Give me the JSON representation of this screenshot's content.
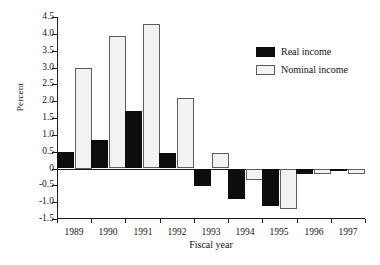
{
  "chart_data": {
    "type": "bar",
    "title": "",
    "xlabel": "Fiscal year",
    "ylabel": "Percent",
    "categories": [
      "1989",
      "1990",
      "1991",
      "1992",
      "1993",
      "1994",
      "1995",
      "1996",
      "1997"
    ],
    "series": [
      {
        "name": "Real income",
        "color": "#0d0d0d",
        "values": [
          0.5,
          0.85,
          1.7,
          0.45,
          -0.52,
          -0.92,
          -1.12,
          -0.15,
          -0.07
        ]
      },
      {
        "name": "Nominal income",
        "color": "#f2f2f0",
        "values": [
          3.0,
          3.95,
          4.3,
          2.1,
          0.45,
          -0.35,
          -1.2,
          -0.17,
          -0.15
        ]
      }
    ],
    "ylim": [
      -1.5,
      4.5
    ],
    "yticks": [
      4.5,
      4.0,
      3.5,
      3.0,
      2.5,
      2.0,
      1.5,
      1.0,
      0.5,
      0,
      -0.5,
      -1.0,
      -1.5
    ],
    "ytick_labels": [
      "4.5",
      "4.0",
      "3.5",
      "3.0",
      "2.5",
      "2.0",
      "1.5",
      "1.0",
      "0.5",
      "0",
      "-0.5",
      "-1.0",
      "-1.5"
    ],
    "grid": false,
    "legend_position": "upper-right",
    "legend_entries": [
      "Real income",
      "Nominal income"
    ]
  }
}
